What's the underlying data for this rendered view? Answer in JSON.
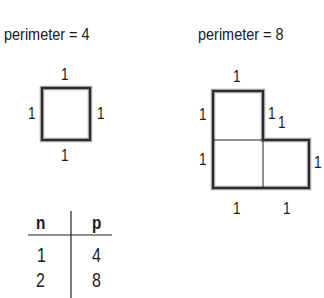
{
  "figures": [
    {
      "title": "perimeter = 4",
      "shape": "single unit square",
      "side_labels": {
        "top": "1",
        "left": "1",
        "right": "1",
        "bottom": "1"
      }
    },
    {
      "title": "perimeter = 8",
      "shape": "L-shaped figure of 3 unit squares",
      "side_labels": {
        "top": "1",
        "left_upper": "1",
        "left_lower": "1",
        "inner_vertical": "1",
        "inner_horizontal": "1",
        "right": "1",
        "bottom_left": "1",
        "bottom_right": "1"
      }
    }
  ],
  "table": {
    "headers": [
      "n",
      "p"
    ],
    "rows": [
      [
        "1",
        "4"
      ],
      [
        "2",
        "8"
      ]
    ]
  },
  "colors": {
    "outline": "#333333",
    "outline_shadow": "#9a9a9a",
    "inner_line": "#222222"
  }
}
